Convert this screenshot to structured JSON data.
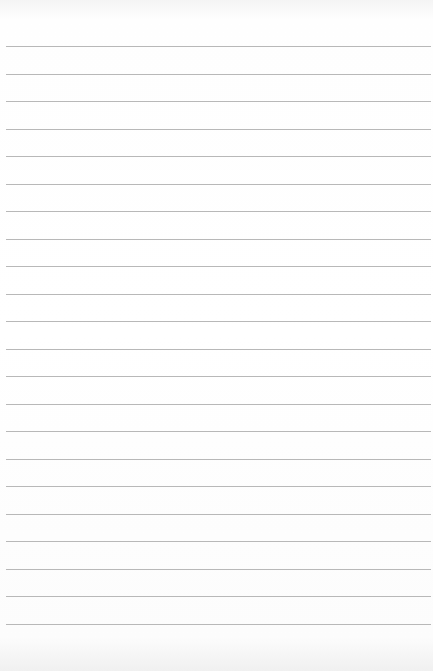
{
  "paper": {
    "type": "lined-paper",
    "line_color": "#b8b8b8",
    "background": "#ffffff",
    "first_line_y": 46,
    "line_spacing": 27.52,
    "line_count": 22
  }
}
